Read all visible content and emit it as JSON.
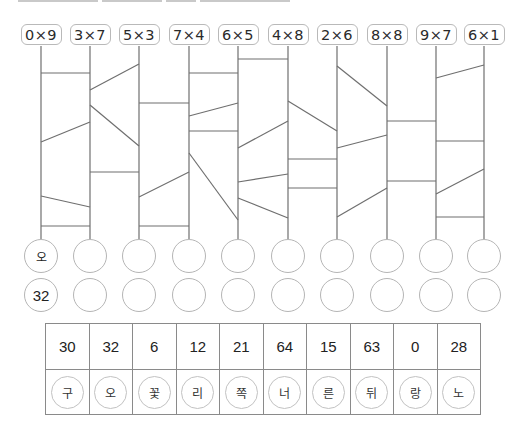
{
  "heading": {
    "visible_text": ""
  },
  "ladder": {
    "columns_x": [
      41,
      90,
      139,
      189,
      238,
      288,
      337,
      387,
      436,
      484
    ],
    "top_y": 46,
    "bottom_y": 239,
    "line_color": "#6f6f6f",
    "expressions": [
      "0×9",
      "3×7",
      "5×3",
      "7×4",
      "6×5",
      "4×8",
      "2×6",
      "8×8",
      "9×7",
      "6×1"
    ],
    "rungs": [
      {
        "from_col": 0,
        "to_col": 1,
        "y1": 73,
        "y2": 73
      },
      {
        "from_col": 0,
        "to_col": 1,
        "y1": 142,
        "y2": 122
      },
      {
        "from_col": 0,
        "to_col": 1,
        "y1": 196,
        "y2": 207
      },
      {
        "from_col": 0,
        "to_col": 1,
        "y1": 226,
        "y2": 226
      },
      {
        "from_col": 1,
        "to_col": 2,
        "y1": 90,
        "y2": 64
      },
      {
        "from_col": 1,
        "to_col": 2,
        "y1": 105,
        "y2": 146
      },
      {
        "from_col": 1,
        "to_col": 2,
        "y1": 172,
        "y2": 172
      },
      {
        "from_col": 2,
        "to_col": 3,
        "y1": 103,
        "y2": 103
      },
      {
        "from_col": 2,
        "to_col": 3,
        "y1": 197,
        "y2": 172
      },
      {
        "from_col": 2,
        "to_col": 3,
        "y1": 226,
        "y2": 226
      },
      {
        "from_col": 3,
        "to_col": 4,
        "y1": 73,
        "y2": 73
      },
      {
        "from_col": 3,
        "to_col": 4,
        "y1": 116,
        "y2": 103
      },
      {
        "from_col": 3,
        "to_col": 4,
        "y1": 131,
        "y2": 131
      },
      {
        "from_col": 3,
        "to_col": 4,
        "y1": 153,
        "y2": 220
      },
      {
        "from_col": 4,
        "to_col": 5,
        "y1": 59,
        "y2": 59
      },
      {
        "from_col": 4,
        "to_col": 5,
        "y1": 148,
        "y2": 121
      },
      {
        "from_col": 4,
        "to_col": 5,
        "y1": 182,
        "y2": 174
      },
      {
        "from_col": 4,
        "to_col": 5,
        "y1": 198,
        "y2": 218
      },
      {
        "from_col": 5,
        "to_col": 6,
        "y1": 101,
        "y2": 131
      },
      {
        "from_col": 5,
        "to_col": 6,
        "y1": 159,
        "y2": 159
      },
      {
        "from_col": 5,
        "to_col": 6,
        "y1": 188,
        "y2": 188
      },
      {
        "from_col": 6,
        "to_col": 7,
        "y1": 66,
        "y2": 106
      },
      {
        "from_col": 6,
        "to_col": 7,
        "y1": 148,
        "y2": 135
      },
      {
        "from_col": 6,
        "to_col": 7,
        "y1": 217,
        "y2": 188
      },
      {
        "from_col": 7,
        "to_col": 8,
        "y1": 121,
        "y2": 121
      },
      {
        "from_col": 7,
        "to_col": 8,
        "y1": 181,
        "y2": 181
      },
      {
        "from_col": 8,
        "to_col": 9,
        "y1": 78,
        "y2": 65
      },
      {
        "from_col": 8,
        "to_col": 9,
        "y1": 141,
        "y2": 141
      },
      {
        "from_col": 8,
        "to_col": 9,
        "y1": 194,
        "y2": 169
      },
      {
        "from_col": 8,
        "to_col": 9,
        "y1": 217,
        "y2": 217
      }
    ]
  },
  "answer_rows": {
    "characters": [
      "오",
      "",
      "",
      "",
      "",
      "",
      "",
      "",
      "",
      ""
    ],
    "products": [
      "32",
      "",
      "",
      "",
      "",
      "",
      "",
      "",
      "",
      ""
    ]
  },
  "lookup_table": {
    "numbers": [
      "30",
      "32",
      "6",
      "12",
      "21",
      "64",
      "15",
      "63",
      "0",
      "28"
    ],
    "characters": [
      "구",
      "오",
      "꽃",
      "리",
      "쪽",
      "너",
      "른",
      "뒤",
      "랑",
      "노"
    ]
  }
}
